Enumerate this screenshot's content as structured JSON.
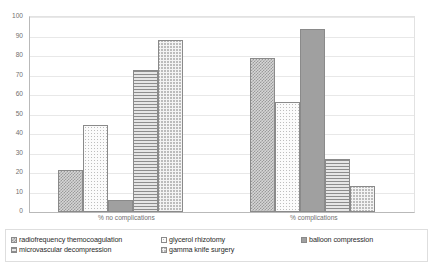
{
  "chart_data": {
    "type": "bar",
    "title": "",
    "subtitle": "",
    "xlabel": "",
    "ylabel": "",
    "ylim": [
      0,
      100
    ],
    "ytick_step": 10,
    "yticks": [
      0,
      10,
      20,
      30,
      40,
      50,
      60,
      70,
      80,
      90,
      100
    ],
    "grid": true,
    "legend_position": "bottom",
    "categories": [
      "% no complications",
      "% complications"
    ],
    "series": [
      {
        "name": "radiofrequency themocoagulation",
        "pattern": "checker",
        "values": [
          21.5,
          79
        ]
      },
      {
        "name": "glycerol rhizotomy",
        "pattern": "dots",
        "values": [
          44.5,
          56.5
        ]
      },
      {
        "name": "balloon compression",
        "pattern": "solid",
        "values": [
          6,
          94
        ]
      },
      {
        "name": "microvascular decompression",
        "pattern": "hlines",
        "values": [
          73,
          27
        ]
      },
      {
        "name": "gamma knife surgery",
        "pattern": "zigzag",
        "values": [
          88,
          13.5
        ]
      }
    ]
  },
  "legend": {
    "items": [
      {
        "label": "radiofrequency themocoagulation",
        "pattern": "checker"
      },
      {
        "label": "glycerol rhizotomy",
        "pattern": "dots"
      },
      {
        "label": "balloon compression",
        "pattern": "solid"
      },
      {
        "label": "microvascular decompression",
        "pattern": "hlines"
      },
      {
        "label": "gamma knife surgery",
        "pattern": "zigzag"
      }
    ]
  },
  "colors": {
    "axis": "#b9b9b9",
    "grid": "#e8e8e8",
    "tick_text": "#707070",
    "legend_text": "#2b2b2b",
    "bar_border": "#8a8a8a",
    "background": "#ffffff"
  }
}
